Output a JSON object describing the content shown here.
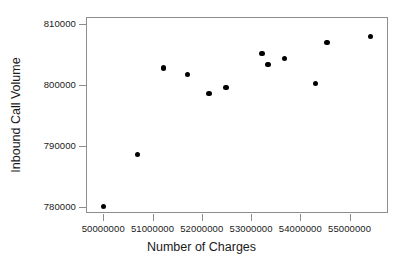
{
  "chart_data": {
    "type": "scatter",
    "title": "",
    "xlabel": "Number of Charges",
    "ylabel": "Inbound Call Volume",
    "xlim": [
      49650000,
      55780000
    ],
    "ylim": [
      779000,
      811200
    ],
    "grid": false,
    "legend": null,
    "marker": {
      "shape": "circle",
      "filled": true,
      "color": "#000000",
      "size_px": 5.4
    },
    "axes": {
      "frame_color": "#8d8d8d",
      "x_ticks": [
        50000000,
        51000000,
        52000000,
        53000000,
        54000000,
        55000000
      ],
      "x_tick_labels": [
        "50000000",
        "51000000",
        "52000000",
        "53000000",
        "54000000",
        "55000000"
      ],
      "y_ticks": [
        780000,
        790000,
        800000,
        810000
      ],
      "y_tick_labels": [
        "780000",
        "790000",
        "800000",
        "810000"
      ]
    },
    "points": [
      {
        "x": 49990000,
        "y": 780200
      },
      {
        "x": 50670000,
        "y": 788800
      },
      {
        "x": 51200000,
        "y": 803000
      },
      {
        "x": 51690000,
        "y": 801900
      },
      {
        "x": 52130000,
        "y": 798800
      },
      {
        "x": 52470000,
        "y": 799800
      },
      {
        "x": 53200000,
        "y": 805400
      },
      {
        "x": 53320000,
        "y": 803600
      },
      {
        "x": 53660000,
        "y": 804500
      },
      {
        "x": 54290000,
        "y": 800400
      },
      {
        "x": 54520000,
        "y": 807200
      },
      {
        "x": 55400000,
        "y": 808200
      }
    ]
  }
}
